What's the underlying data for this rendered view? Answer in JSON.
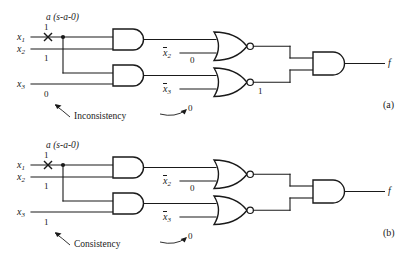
{
  "figure": {
    "type": "logic-circuit-fault-test",
    "panels": [
      {
        "id": "a",
        "panel_label": "(a)",
        "fault_label": "a (s-a-0)",
        "fault_marker": "x",
        "inputs": [
          {
            "name": "x1",
            "label": "x",
            "subscript": "1",
            "value": "1"
          },
          {
            "name": "x2",
            "label": "x",
            "subscript": "2",
            "value": "1"
          },
          {
            "name": "x3",
            "label": "x",
            "subscript": "3",
            "value": "0"
          }
        ],
        "inverted_inputs": [
          {
            "name": "x2bar",
            "label": "x",
            "subscript": "2",
            "value": "0"
          },
          {
            "name": "x3bar",
            "label": "x",
            "subscript": "3",
            "value": ""
          }
        ],
        "gate_values": [
          {
            "name": "lower-nor-output",
            "value": "1"
          }
        ],
        "annotation": {
          "text": "Inconsistency",
          "left_target_value": "0",
          "right_target_value": "0"
        },
        "output": {
          "name": "f",
          "label": "f"
        }
      },
      {
        "id": "b",
        "panel_label": "(b)",
        "fault_label": "a (s-a-0)",
        "fault_marker": "x",
        "inputs": [
          {
            "name": "x1",
            "label": "x",
            "subscript": "1",
            "value": "1"
          },
          {
            "name": "x2",
            "label": "x",
            "subscript": "2",
            "value": "1"
          },
          {
            "name": "x3",
            "label": "x",
            "subscript": "3",
            "value": "1"
          }
        ],
        "inverted_inputs": [
          {
            "name": "x2bar",
            "label": "x",
            "subscript": "2",
            "value": "0"
          },
          {
            "name": "x3bar",
            "label": "x",
            "subscript": "3",
            "value": ""
          }
        ],
        "gate_values": [],
        "annotation": {
          "text": "Consistency",
          "left_target_value": "1",
          "right_target_value": "0"
        },
        "output": {
          "name": "f",
          "label": "f"
        }
      }
    ],
    "gates": {
      "and_upper": "AND",
      "and_lower": "AND",
      "nor_upper": "NOR",
      "nor_lower": "NOR",
      "and_output": "AND"
    },
    "colors": {
      "ink": "#1a1a1a",
      "background": "#ffffff"
    }
  }
}
